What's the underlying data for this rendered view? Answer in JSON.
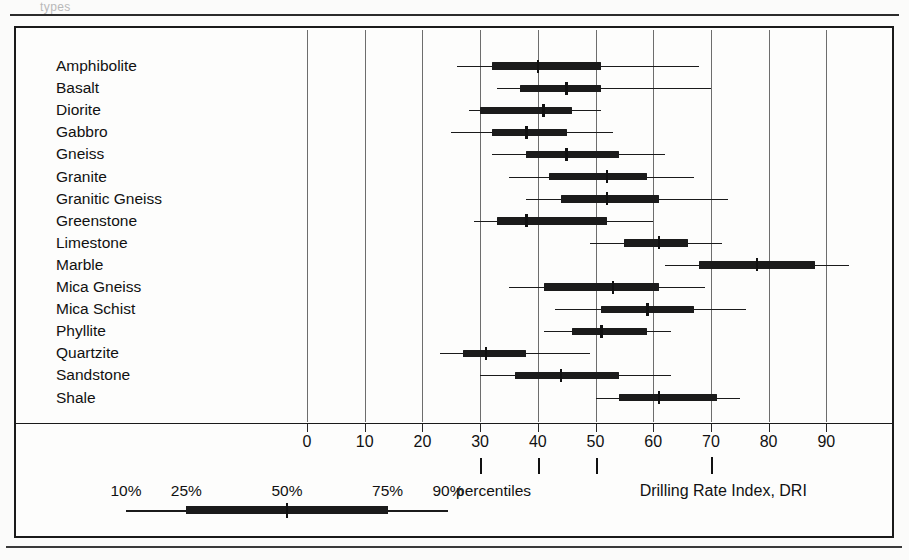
{
  "figure": {
    "axis_title": "Drilling Rate Index, DRI",
    "percentiles_label": "percentiles",
    "top_ghost_text": "types"
  },
  "axis": {
    "ticks": [
      0,
      10,
      20,
      30,
      40,
      50,
      60,
      70,
      80,
      90
    ],
    "tick_labels": [
      "0",
      "10",
      "20",
      "30",
      "40",
      "50",
      "60",
      "70",
      "80",
      "90"
    ],
    "min": -15,
    "max": 100,
    "gridlines": [
      0,
      10,
      20,
      30,
      40,
      50,
      60,
      70,
      80,
      90
    ]
  },
  "legend": {
    "labels": [
      "10%",
      "25%",
      "50%",
      "75%",
      "90%"
    ],
    "values": [
      10,
      25,
      50,
      75,
      90
    ],
    "pointer_values": [
      30,
      40,
      50
    ]
  },
  "chart_data": {
    "type": "box",
    "title": "",
    "xlabel": "Drilling Rate Index, DRI",
    "ylabel": "",
    "xlim": [
      -15,
      100
    ],
    "grid": true,
    "percentiles": [
      "10%",
      "25%",
      "50%",
      "75%",
      "90%"
    ],
    "categories": [
      "Amphibolite",
      "Basalt",
      "Diorite",
      "Gabbro",
      "Gneiss",
      "Granite",
      "Granitic Gneiss",
      "Greenstone",
      "Limestone",
      "Marble",
      "Mica Gneiss",
      "Mica Schist",
      "Phyllite",
      "Quartzite",
      "Sandstone",
      "Shale"
    ],
    "boxes": [
      {
        "name": "Amphibolite",
        "p10": 26,
        "p25": 32,
        "p50": 40,
        "p75": 51,
        "p90": 68
      },
      {
        "name": "Basalt",
        "p25": 37,
        "p10": 33,
        "p50": 45,
        "p75": 51,
        "p90": 70
      },
      {
        "name": "Diorite",
        "p10": 28,
        "p25": 30,
        "p50": 41,
        "p75": 46,
        "p90": 51
      },
      {
        "name": "Gabbro",
        "p10": 25,
        "p25": 32,
        "p50": 38,
        "p75": 45,
        "p90": 53
      },
      {
        "name": "Gneiss",
        "p10": 32,
        "p25": 38,
        "p50": 45,
        "p75": 54,
        "p90": 62
      },
      {
        "name": "Granite",
        "p10": 35,
        "p25": 42,
        "p50": 52,
        "p75": 59,
        "p90": 67
      },
      {
        "name": "Granitic Gneiss",
        "p10": 38,
        "p25": 44,
        "p50": 52,
        "p75": 61,
        "p90": 73
      },
      {
        "name": "Greenstone",
        "p10": 29,
        "p25": 33,
        "p50": 38,
        "p75": 52,
        "p90": 60
      },
      {
        "name": "Limestone",
        "p10": 49,
        "p25": 55,
        "p50": 61,
        "p75": 66,
        "p90": 72
      },
      {
        "name": "Marble",
        "p10": 62,
        "p25": 68,
        "p50": 78,
        "p75": 88,
        "p90": 94
      },
      {
        "name": "Mica Gneiss",
        "p10": 35,
        "p25": 41,
        "p50": 53,
        "p75": 61,
        "p90": 69
      },
      {
        "name": "Mica Schist",
        "p10": 43,
        "p25": 51,
        "p50": 59,
        "p75": 67,
        "p90": 76
      },
      {
        "name": "Phyllite",
        "p10": 41,
        "p25": 46,
        "p50": 51,
        "p75": 59,
        "p90": 63
      },
      {
        "name": "Quartzite",
        "p10": 23,
        "p25": 27,
        "p50": 31,
        "p75": 38,
        "p90": 49
      },
      {
        "name": "Sandstone",
        "p10": 30,
        "p25": 36,
        "p50": 44,
        "p75": 54,
        "p90": 63
      },
      {
        "name": "Shale",
        "p10": 50,
        "p25": 54,
        "p50": 61,
        "p75": 71,
        "p90": 75
      }
    ]
  }
}
